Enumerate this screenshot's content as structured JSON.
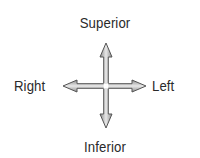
{
  "diagram": {
    "type": "anatomical-directional-compass",
    "labels": {
      "top": "Superior",
      "bottom": "Inferior",
      "left": "Right",
      "right": "Left"
    },
    "arrows": {
      "count": 2,
      "orientation": [
        "vertical",
        "horizontal"
      ],
      "style": "double-headed, outlined, gray gradient fill"
    },
    "colors": {
      "text": "#2a2a2a",
      "arrow_outline": "#555555",
      "arrow_fill": "#a8a8a8",
      "arrow_center": "#ffffff",
      "background": "#ffffff"
    }
  }
}
